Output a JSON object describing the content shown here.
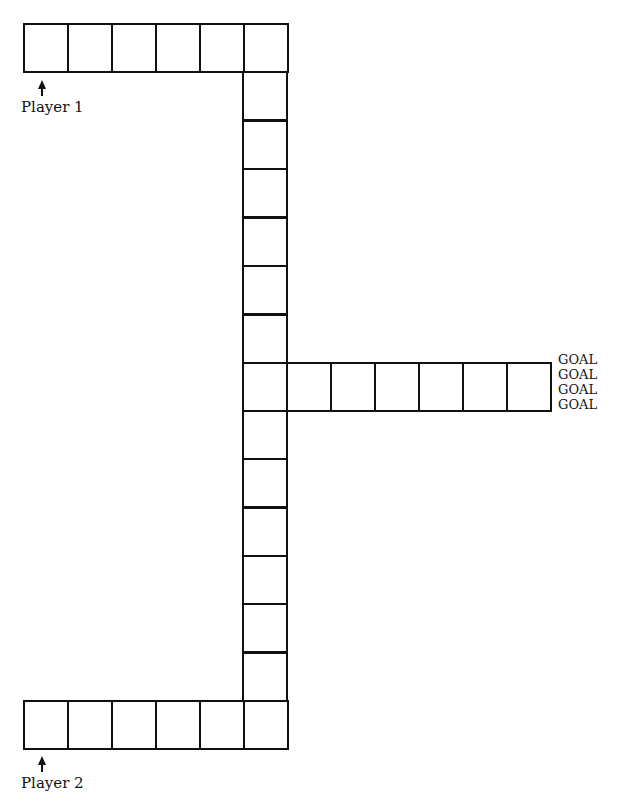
{
  "board": {
    "cell_size": {
      "w": 44,
      "h": 48
    },
    "top_row": {
      "x": 23,
      "y": 23,
      "count": 6
    },
    "column": {
      "x": 242,
      "y_start": 71,
      "count_upper": 6,
      "count_lower": 6
    },
    "branch": {
      "x": 242,
      "y": 362,
      "count": 7
    },
    "bottom_row": {
      "x": 23,
      "y": 700,
      "count": 6
    }
  },
  "labels": {
    "player1": "Player 1",
    "player2": "Player 2"
  },
  "goals": [
    "GOAL",
    "GOAL",
    "GOAL",
    "GOAL"
  ]
}
